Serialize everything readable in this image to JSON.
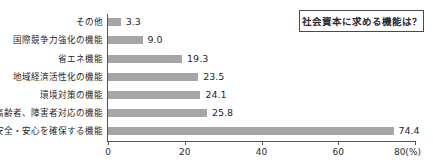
{
  "title_box": {
    "text": "社会資本に求める機能は？"
  },
  "chart_data": {
    "type": "bar",
    "orientation": "horizontal",
    "title": "社会資本に求める機能は？",
    "xlabel": "(%)",
    "ylabel": "",
    "xlim": [
      0,
      80
    ],
    "xticks": [
      0,
      20,
      40,
      60,
      80
    ],
    "xtick_labels": [
      "0",
      "20",
      "40",
      "60",
      "80(%)"
    ],
    "unit": "(%)",
    "grid": false,
    "legend": false,
    "bar_color": "#a6a6a6",
    "axis_color": "#555555",
    "categories": [
      "その他",
      "国際競争力強化の機能",
      "省エネ機能",
      "地域経済活性化の機能",
      "環境対策の機能",
      "高齢者、障害者対応の機能",
      "安全・安心を確保する機能"
    ],
    "values": [
      3.3,
      9.0,
      19.3,
      23.5,
      24.1,
      25.8,
      74.4
    ],
    "value_labels": [
      "3.3",
      "9.0",
      "19.3",
      "23.5",
      "24.1",
      "25.8",
      "74.4"
    ]
  }
}
